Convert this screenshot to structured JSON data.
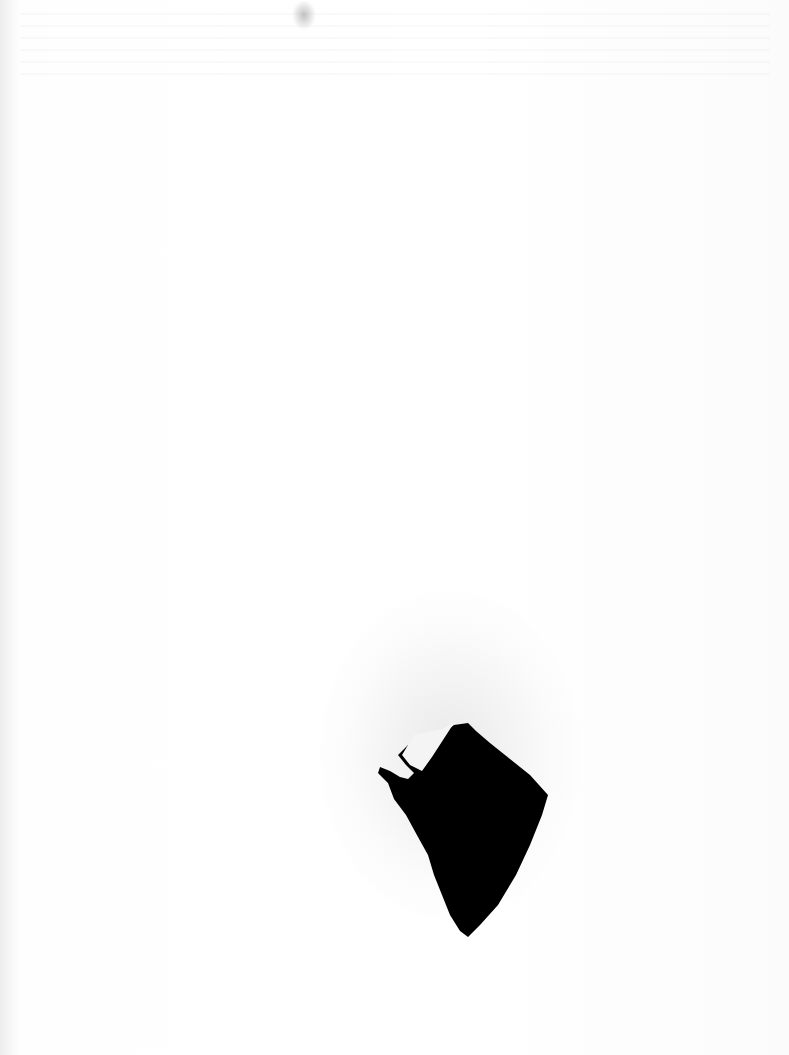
{
  "document": {
    "type": "scanned blank page",
    "text": "",
    "features": {
      "hole": {
        "color": "#000000",
        "icon": "torn-hole-shape"
      },
      "background_color": "#ffffff"
    }
  }
}
